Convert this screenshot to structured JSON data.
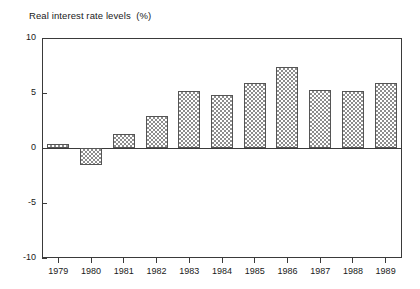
{
  "chart_data": {
    "type": "bar",
    "title": "Real interest rate levels  (%)",
    "xlabel": "",
    "ylabel": "",
    "ylim": [
      -10,
      10
    ],
    "yticks": [
      10,
      5,
      0,
      -5,
      -10
    ],
    "ytick_labels": [
      "10",
      "5",
      "0",
      "-5",
      "-10"
    ],
    "grid": false,
    "legend": "none",
    "zero_line": true,
    "categories": [
      "1979",
      "1980",
      "1981",
      "1982",
      "1983",
      "1984",
      "1985",
      "1986",
      "1987",
      "1988",
      "1989"
    ],
    "values": [
      0.4,
      -1.5,
      1.3,
      2.9,
      5.2,
      4.8,
      5.9,
      7.4,
      5.3,
      5.2,
      5.9
    ],
    "bar_fill": "cross-hatch-checker",
    "bar_edge_color": "#555555",
    "axis_color": "#3a3a3a",
    "background_color": "#ffffff"
  }
}
